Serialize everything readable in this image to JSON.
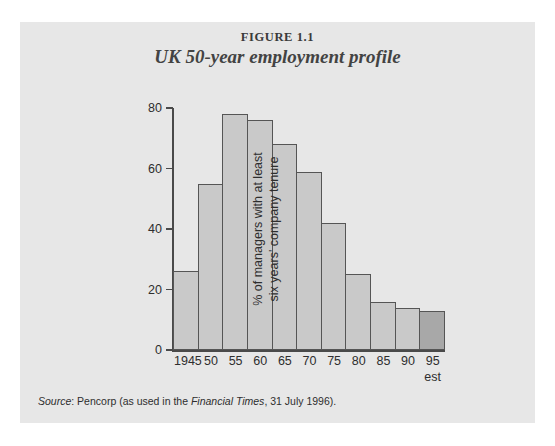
{
  "figure": {
    "number": "FIGURE 1.1",
    "title": "UK 50-year employment profile",
    "source_lead": "Source",
    "source_text_1": ": Pencorp (as used in the ",
    "source_publication": "Financial Times",
    "source_text_2": ", 31 July 1996)."
  },
  "colors": {
    "panel_background": "#e7e7e7",
    "bar_fill": "#c9c9c9",
    "bar_fill_estimate": "#a8a8a8",
    "bar_outline": "#555555",
    "axis": "#4a4a4a",
    "text": "#2e2e2e"
  },
  "chart_data": {
    "type": "bar",
    "title": "UK 50-year employment profile",
    "xlabel": "",
    "ylabel": "% of managers with at least six years' company tenure",
    "ylabel_line1": "% of managers with at least",
    "ylabel_line2": "six years' company tenure",
    "categories": [
      "1945",
      "50",
      "55",
      "60",
      "65",
      "70",
      "75",
      "80",
      "85",
      "90",
      "95"
    ],
    "category_sublabels": [
      "",
      "",
      "",
      "",
      "",
      "",
      "",
      "",
      "",
      "",
      "est"
    ],
    "values": [
      26,
      55,
      78,
      76,
      68,
      59,
      42,
      25,
      16,
      14,
      13
    ],
    "estimate_flags": [
      false,
      false,
      false,
      false,
      false,
      false,
      false,
      false,
      false,
      false,
      true
    ],
    "ylim": [
      0,
      80
    ],
    "yticks": [
      0,
      20,
      40,
      60,
      80
    ],
    "ytick_labels": [
      "0",
      "20",
      "40",
      "60",
      "80"
    ],
    "grid": false,
    "legend": "none"
  }
}
